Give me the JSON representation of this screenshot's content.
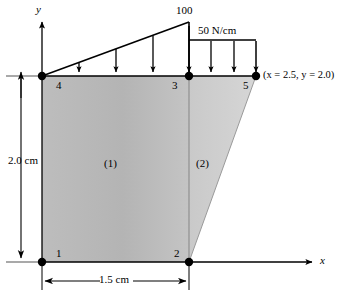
{
  "figure": {
    "type": "engineering-fem-diagram"
  },
  "axes": {
    "y_label": "y",
    "x_label": "x"
  },
  "nodes": [
    {
      "id": "1",
      "label": "1",
      "x": 42,
      "y": 262
    },
    {
      "id": "2",
      "label": "2",
      "x": 189,
      "y": 262
    },
    {
      "id": "3",
      "label": "3",
      "x": 189,
      "y": 76
    },
    {
      "id": "4",
      "label": "4",
      "x": 42,
      "y": 76
    },
    {
      "id": "5",
      "label": "5",
      "x": 256,
      "y": 76
    }
  ],
  "elements": [
    {
      "id": "1",
      "label": "(1)",
      "shape": "quad",
      "fill": "#b8b8b8"
    },
    {
      "id": "2",
      "label": "(2)",
      "shape": "triangle",
      "fill": "#cfcfcf"
    }
  ],
  "loads": {
    "triangular": {
      "peak_label": "100",
      "span_from_node": "4",
      "span_to_node": "3",
      "peak_value": 100,
      "start_value": 0
    },
    "uniform": {
      "label": "50 N/cm",
      "value": 50,
      "unit": "N/cm",
      "span_from_node": "3",
      "span_to_node": "5"
    }
  },
  "dimensions": {
    "horizontal": "1.5 cm",
    "vertical": "2.0 cm"
  },
  "annotations": {
    "node5_coords": "(x = 2.5, y = 2.0)"
  },
  "colors": {
    "element1_fill": "#b8b8b8",
    "element2_fill": "#cfcfcf",
    "stroke": "#000000",
    "axis": "#000000"
  }
}
